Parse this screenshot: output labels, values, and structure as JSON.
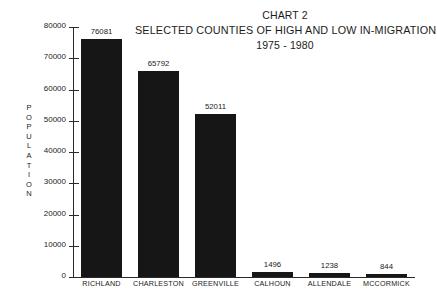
{
  "chart_data": {
    "type": "bar",
    "title": "CHART 2",
    "title_lines": [
      "CHART 2",
      "SELECTED COUNTIES OF HIGH AND LOW IN-MIGRATION",
      "1975 - 1980"
    ],
    "subtitle": "SELECTED COUNTIES OF HIGH AND LOW IN-MIGRATION",
    "period": "1975 - 1980",
    "xlabel": "",
    "ylabel": "POPULATION",
    "ylim": [
      0,
      80000
    ],
    "ytick_step": 10000,
    "ytick_labels": [
      "0",
      "10000",
      "20000",
      "30000",
      "40000",
      "50000",
      "60000",
      "70000",
      "80000"
    ],
    "grid": false,
    "legend": false,
    "bar_color": "#161616",
    "axis_color": "#2a2a2a",
    "text_color": "#1b1b1b",
    "background": "#ffffff",
    "categories": [
      "RICHLAND",
      "CHARLESTON",
      "GREENVILLE",
      "CALHOUN",
      "ALLENDALE",
      "MCCORMICK"
    ],
    "values": [
      76081,
      65792,
      52011,
      1496,
      1238,
      844
    ],
    "value_labels": [
      "76081",
      "65792",
      "52011",
      "1496",
      "1238",
      "844"
    ]
  }
}
